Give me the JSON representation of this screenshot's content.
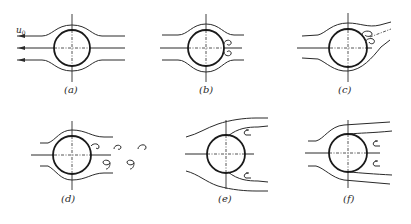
{
  "figure": {
    "inflow_label": "u0",
    "inflow_symbol": "u",
    "inflow_subscript": "0",
    "panels": [
      {
        "id": "a",
        "label": "(a)",
        "regime": "attached laminar flow, no separation"
      },
      {
        "id": "b",
        "label": "(b)",
        "regime": "pair of small standing vortices behind cylinder"
      },
      {
        "id": "c",
        "label": "(c)",
        "regime": "elongated vortex pair, asymmetric"
      },
      {
        "id": "d",
        "label": "(d)",
        "regime": "Karman vortex street, alternate shedding"
      },
      {
        "id": "e",
        "label": "(e)",
        "regime": "early separation, wide wake"
      },
      {
        "id": "f",
        "label": "(f)",
        "regime": "late separation, narrow wake"
      }
    ]
  }
}
